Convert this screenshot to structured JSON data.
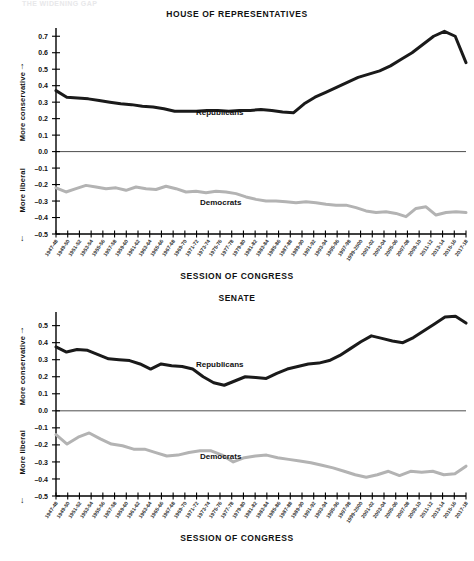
{
  "top_strip_text": "THE WIDENING GAP",
  "charts": [
    {
      "id": "house",
      "title": "HOUSE OF REPRESENTATIVES",
      "footer": "SESSION OF CONGRESS",
      "axis_up_arrow": "↑",
      "axis_down_arrow": "↓",
      "ylabel_top": "More conservative",
      "ylabel_bottom": "More liberal",
      "label_rep": "Republicans",
      "label_dem": "Democrats"
    },
    {
      "id": "senate",
      "title": "SENATE",
      "footer": "SESSION OF CONGRESS",
      "axis_up_arrow": "↑",
      "axis_down_arrow": "↓",
      "ylabel_top": "More conservative",
      "ylabel_bottom": "More liberal",
      "label_rep": "Republicans",
      "label_dem": "Democrats"
    }
  ],
  "colors": {
    "republican": "#1a1a1a",
    "democrat": "#b3b3b3",
    "axis": "#000000",
    "text": "#111111"
  },
  "chart_data": [
    {
      "type": "line",
      "title": "HOUSE OF REPRESENTATIVES",
      "xlabel": "SESSION OF CONGRESS",
      "ylabel": "More conservative / More liberal",
      "ylim": [
        -0.5,
        0.75
      ],
      "yticks": [
        0.7,
        0.6,
        0.5,
        0.4,
        0.3,
        0.2,
        0.1,
        0.0,
        -0.1,
        -0.2,
        -0.3,
        -0.4,
        -0.5
      ],
      "grid": false,
      "legend": "inline-annotation",
      "categories": [
        "1947-48",
        "1949-50",
        "1951-52",
        "1953-54",
        "1955-56",
        "1957-58",
        "1959-60",
        "1961-62",
        "1963-64",
        "1965-66",
        "1967-68",
        "1969-70",
        "1971-72",
        "1973-74",
        "1975-76",
        "1977-78",
        "1979-80",
        "1981-82",
        "1983-84",
        "1985-86",
        "1987-88",
        "1989-90",
        "1991-92",
        "1993-94",
        "1995-96",
        "1997-98",
        "1999-2000",
        "2001-02",
        "2003-04",
        "2005-06",
        "2007-08",
        "2009-10",
        "2011-12",
        "2013-14",
        "2015-16",
        "2017-18"
      ],
      "series": [
        {
          "name": "Republicans",
          "color": "#1a1a1a",
          "values": [
            0.37,
            0.33,
            0.325,
            0.32,
            0.31,
            0.3,
            0.29,
            0.285,
            0.275,
            0.27,
            0.26,
            0.245,
            0.245,
            0.245,
            0.25,
            0.25,
            0.245,
            0.25,
            0.25,
            0.255,
            0.25,
            0.24,
            0.235,
            0.29,
            0.33,
            0.36,
            0.39,
            0.42,
            0.45,
            0.47,
            0.49,
            0.52,
            0.56,
            0.6,
            0.65,
            0.7,
            0.73,
            0.7,
            0.54
          ]
        },
        {
          "name": "Democrats",
          "color": "#b3b3b3",
          "values": [
            -0.22,
            -0.245,
            -0.225,
            -0.205,
            -0.215,
            -0.225,
            -0.22,
            -0.235,
            -0.215,
            -0.225,
            -0.23,
            -0.21,
            -0.225,
            -0.245,
            -0.24,
            -0.25,
            -0.24,
            -0.245,
            -0.255,
            -0.275,
            -0.29,
            -0.3,
            -0.3,
            -0.305,
            -0.31,
            -0.305,
            -0.31,
            -0.32,
            -0.325,
            -0.325,
            -0.34,
            -0.36,
            -0.37,
            -0.365,
            -0.375,
            -0.395,
            -0.345,
            -0.335,
            -0.385,
            -0.37,
            -0.365,
            -0.37
          ]
        }
      ]
    },
    {
      "type": "line",
      "title": "SENATE",
      "xlabel": "SESSION OF CONGRESS",
      "ylabel": "More conservative / More liberal",
      "ylim": [
        -0.5,
        0.58
      ],
      "yticks": [
        0.5,
        0.4,
        0.3,
        0.2,
        0.1,
        0.0,
        -0.1,
        -0.2,
        -0.3,
        -0.4,
        -0.5
      ],
      "grid": false,
      "legend": "inline-annotation",
      "categories": [
        "1947-48",
        "1949-50",
        "1951-52",
        "1953-54",
        "1955-56",
        "1957-58",
        "1959-60",
        "1961-62",
        "1963-64",
        "1965-66",
        "1967-68",
        "1969-70",
        "1971-72",
        "1973-74",
        "1975-76",
        "1977-78",
        "1979-80",
        "1981-82",
        "1983-84",
        "1985-86",
        "1987-88",
        "1989-90",
        "1991-92",
        "1993-94",
        "1995-96",
        "1997-98",
        "1999-2000",
        "2001-02",
        "2003-04",
        "2005-06",
        "2007-08",
        "2009-10",
        "2011-12",
        "2013-14",
        "2015-16",
        "2017-18"
      ],
      "series": [
        {
          "name": "Republicans",
          "color": "#1a1a1a",
          "values": [
            0.375,
            0.345,
            0.36,
            0.355,
            0.33,
            0.305,
            0.3,
            0.295,
            0.275,
            0.245,
            0.275,
            0.265,
            0.26,
            0.245,
            0.2,
            0.165,
            0.15,
            0.175,
            0.2,
            0.195,
            0.19,
            0.22,
            0.245,
            0.26,
            0.275,
            0.28,
            0.295,
            0.325,
            0.365,
            0.405,
            0.44,
            0.425,
            0.41,
            0.4,
            0.43,
            0.47,
            0.51,
            0.55,
            0.555,
            0.515
          ]
        },
        {
          "name": "Democrats",
          "color": "#b3b3b3",
          "values": [
            -0.14,
            -0.195,
            -0.155,
            -0.13,
            -0.165,
            -0.195,
            -0.205,
            -0.225,
            -0.225,
            -0.245,
            -0.265,
            -0.26,
            -0.245,
            -0.235,
            -0.235,
            -0.26,
            -0.3,
            -0.275,
            -0.265,
            -0.26,
            -0.275,
            -0.285,
            -0.295,
            -0.305,
            -0.32,
            -0.335,
            -0.355,
            -0.375,
            -0.39,
            -0.375,
            -0.355,
            -0.38,
            -0.355,
            -0.36,
            -0.355,
            -0.375,
            -0.37,
            -0.325
          ]
        }
      ]
    }
  ]
}
